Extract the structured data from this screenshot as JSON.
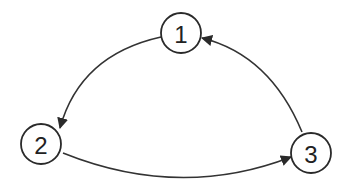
{
  "diagram": {
    "type": "directed-cycle",
    "colors": {
      "stroke": "#2a2a2a",
      "text": "#222222",
      "background": "#ffffff"
    },
    "nodes": [
      {
        "id": "1",
        "label": "1",
        "cx": 181,
        "cy": 33,
        "r": 20
      },
      {
        "id": "2",
        "label": "2",
        "cx": 41,
        "cy": 144,
        "r": 20
      },
      {
        "id": "3",
        "label": "3",
        "cx": 311,
        "cy": 153,
        "r": 20
      }
    ],
    "edges": [
      {
        "from": "1",
        "to": "2",
        "path": "M 161 37 Q 80 55 60 128"
      },
      {
        "from": "2",
        "to": "3",
        "path": "M 63 153 Q 180 200 291 157"
      },
      {
        "from": "3",
        "to": "1",
        "path": "M 302 132 Q 270 55 202 38"
      }
    ]
  }
}
